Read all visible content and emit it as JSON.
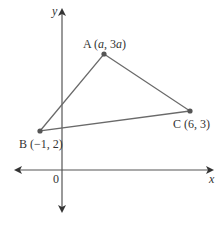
{
  "diagram": {
    "axes": {
      "x_label": "x",
      "y_label": "y",
      "origin_label": "0"
    },
    "points": [
      {
        "name": "A",
        "label_prefix": "A (",
        "label_x": "a",
        "label_sep": ", 3",
        "label_y": "a",
        "label_suffix": ")",
        "coord_text": "A (a, 3a)"
      },
      {
        "name": "B",
        "label": "B (−1, 2)"
      },
      {
        "name": "C",
        "label": "C (6, 3)"
      }
    ],
    "shape": "triangle ABC",
    "colors": {
      "line": "#6a6a6a",
      "axis": "#555555",
      "point": "#555555",
      "text": "#333333"
    }
  }
}
